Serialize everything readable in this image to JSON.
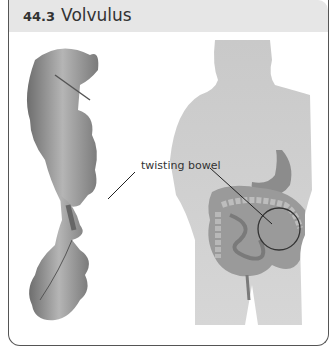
{
  "figure": {
    "number": "44.3",
    "title": "Volvulus"
  },
  "labels": {
    "twisting_bowel": "twisting bowel"
  },
  "colors": {
    "header_bg": "#e6e6e6",
    "border": "#555555",
    "silhouette": "#c8c8c8",
    "organ": "#8a8a8a"
  }
}
